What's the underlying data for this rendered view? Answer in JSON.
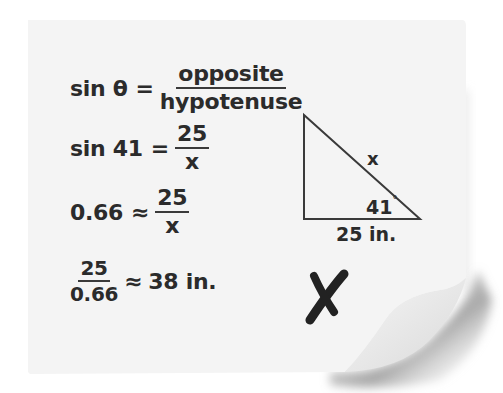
{
  "equations": [
    {
      "lhs": "sin θ",
      "operator": "=",
      "fraction": {
        "numerator": "opposite",
        "denominator": "hypotenuse"
      }
    },
    {
      "lhs": "sin 41",
      "operator": "=",
      "fraction": {
        "numerator": "25",
        "denominator": "x"
      }
    },
    {
      "lhs": "0.66",
      "operator": "≈",
      "fraction": {
        "numerator": "25",
        "denominator": "x"
      }
    },
    {
      "fraction": {
        "numerator": "25",
        "denominator": "0.66"
      },
      "operator": "≈",
      "rhs": "38 in."
    }
  ],
  "triangle": {
    "hypotenuse_label": "x",
    "angle_label": "41",
    "angle_unit": "°",
    "base_label": "25 in."
  },
  "mark": {
    "symbol": "X",
    "meaning": "incorrect",
    "color": "#222222"
  },
  "colors": {
    "paper": "#f4f4f4",
    "ink": "#2b2b2b",
    "shadow": "#9a9a9a"
  }
}
